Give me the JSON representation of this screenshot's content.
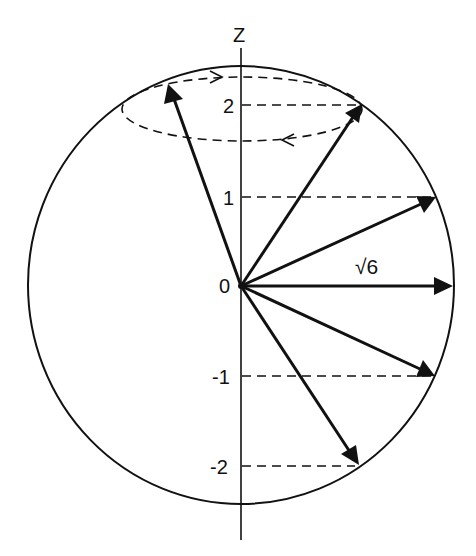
{
  "figure": {
    "type": "vector-model-diagram",
    "axis_label": "Z",
    "magnitude_label": "√6",
    "origin_label": "0",
    "tick_labels": [
      "2",
      "1",
      "0",
      "-1",
      "-2"
    ],
    "colors": {
      "ink": "#111111",
      "background": "#ffffff"
    }
  },
  "geometry": {
    "origin": [
      241,
      286
    ],
    "sphere": {
      "cx": 241,
      "cy": 285,
      "rx": 213,
      "ry": 219
    },
    "z_axis": {
      "x": 241,
      "y1": 48,
      "y2": 540
    },
    "unit_px": 90,
    "precession_cone_ellipse": {
      "cx": 242,
      "cy": 109,
      "rx": 120,
      "ry": 32
    },
    "vectors": [
      {
        "name": "m=2-front",
        "m": 2,
        "tip": [
          362,
          104
        ]
      },
      {
        "name": "m=2-back",
        "m": 2,
        "tip": [
          168,
          84
        ]
      },
      {
        "name": "m=1",
        "m": 1,
        "tip": [
          436,
          197
        ]
      },
      {
        "name": "m=0",
        "m": 0,
        "tip": [
          453,
          286
        ]
      },
      {
        "name": "m=-1",
        "m": -1,
        "tip": [
          435,
          376
        ]
      },
      {
        "name": "m=-2",
        "m": -2,
        "tip": [
          359,
          465
        ]
      }
    ],
    "projection_lines": [
      {
        "m": 2,
        "y": 105,
        "x2": 362
      },
      {
        "m": 1,
        "y": 197,
        "x2": 436
      },
      {
        "m": -1,
        "y": 376,
        "x2": 435
      },
      {
        "m": -2,
        "y": 466,
        "x2": 359
      }
    ]
  }
}
